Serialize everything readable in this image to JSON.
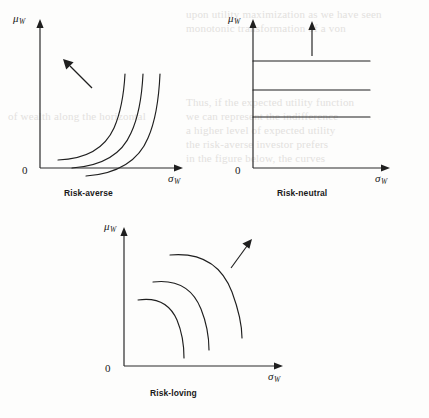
{
  "figure": {
    "axis_y_label": "μ",
    "axis_y_sub": "W",
    "axis_x_label": "σ",
    "axis_x_sub": "W",
    "origin_label": "0"
  },
  "panels": [
    {
      "id": "risk-averse",
      "caption": "Risk-averse",
      "curve_shape": "convex-increasing",
      "arrow_direction": "up-left",
      "curve_count": 3
    },
    {
      "id": "risk-neutral",
      "caption": "Risk-neutral",
      "curve_shape": "horizontal",
      "arrow_direction": "up",
      "curve_count": 3
    },
    {
      "id": "risk-loving",
      "caption": "Risk-loving",
      "curve_shape": "concave-decreasing",
      "arrow_direction": "up-right",
      "curve_count": 3
    }
  ],
  "bleed_through": {
    "lines": [
      "upon utility maximization as we have seen",
      "monotonic transformation of a von",
      "Thus, if the expected utility function",
      "we can represent the indifference",
      "a higher level of expected utility",
      "the risk-averse investor prefers",
      "in the figure below, the curves",
      "of wealth along the horizontal"
    ]
  },
  "colors": {
    "ink": "#1f1f1f",
    "axis": "#2b2b2b",
    "paper": "#fdfdfc",
    "bleed": "#e3e1de"
  }
}
